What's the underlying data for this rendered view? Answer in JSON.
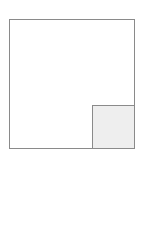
{
  "diagram": {
    "shapes": [
      {
        "id": "outer-square",
        "type": "rectangle",
        "fill": "#ffffff",
        "stroke": "#8a8a8a"
      },
      {
        "id": "inner-square",
        "type": "rectangle",
        "position": "bottom-right corner of outer square",
        "fill": "#eeeeee",
        "stroke": "#8a8a8a"
      }
    ]
  }
}
